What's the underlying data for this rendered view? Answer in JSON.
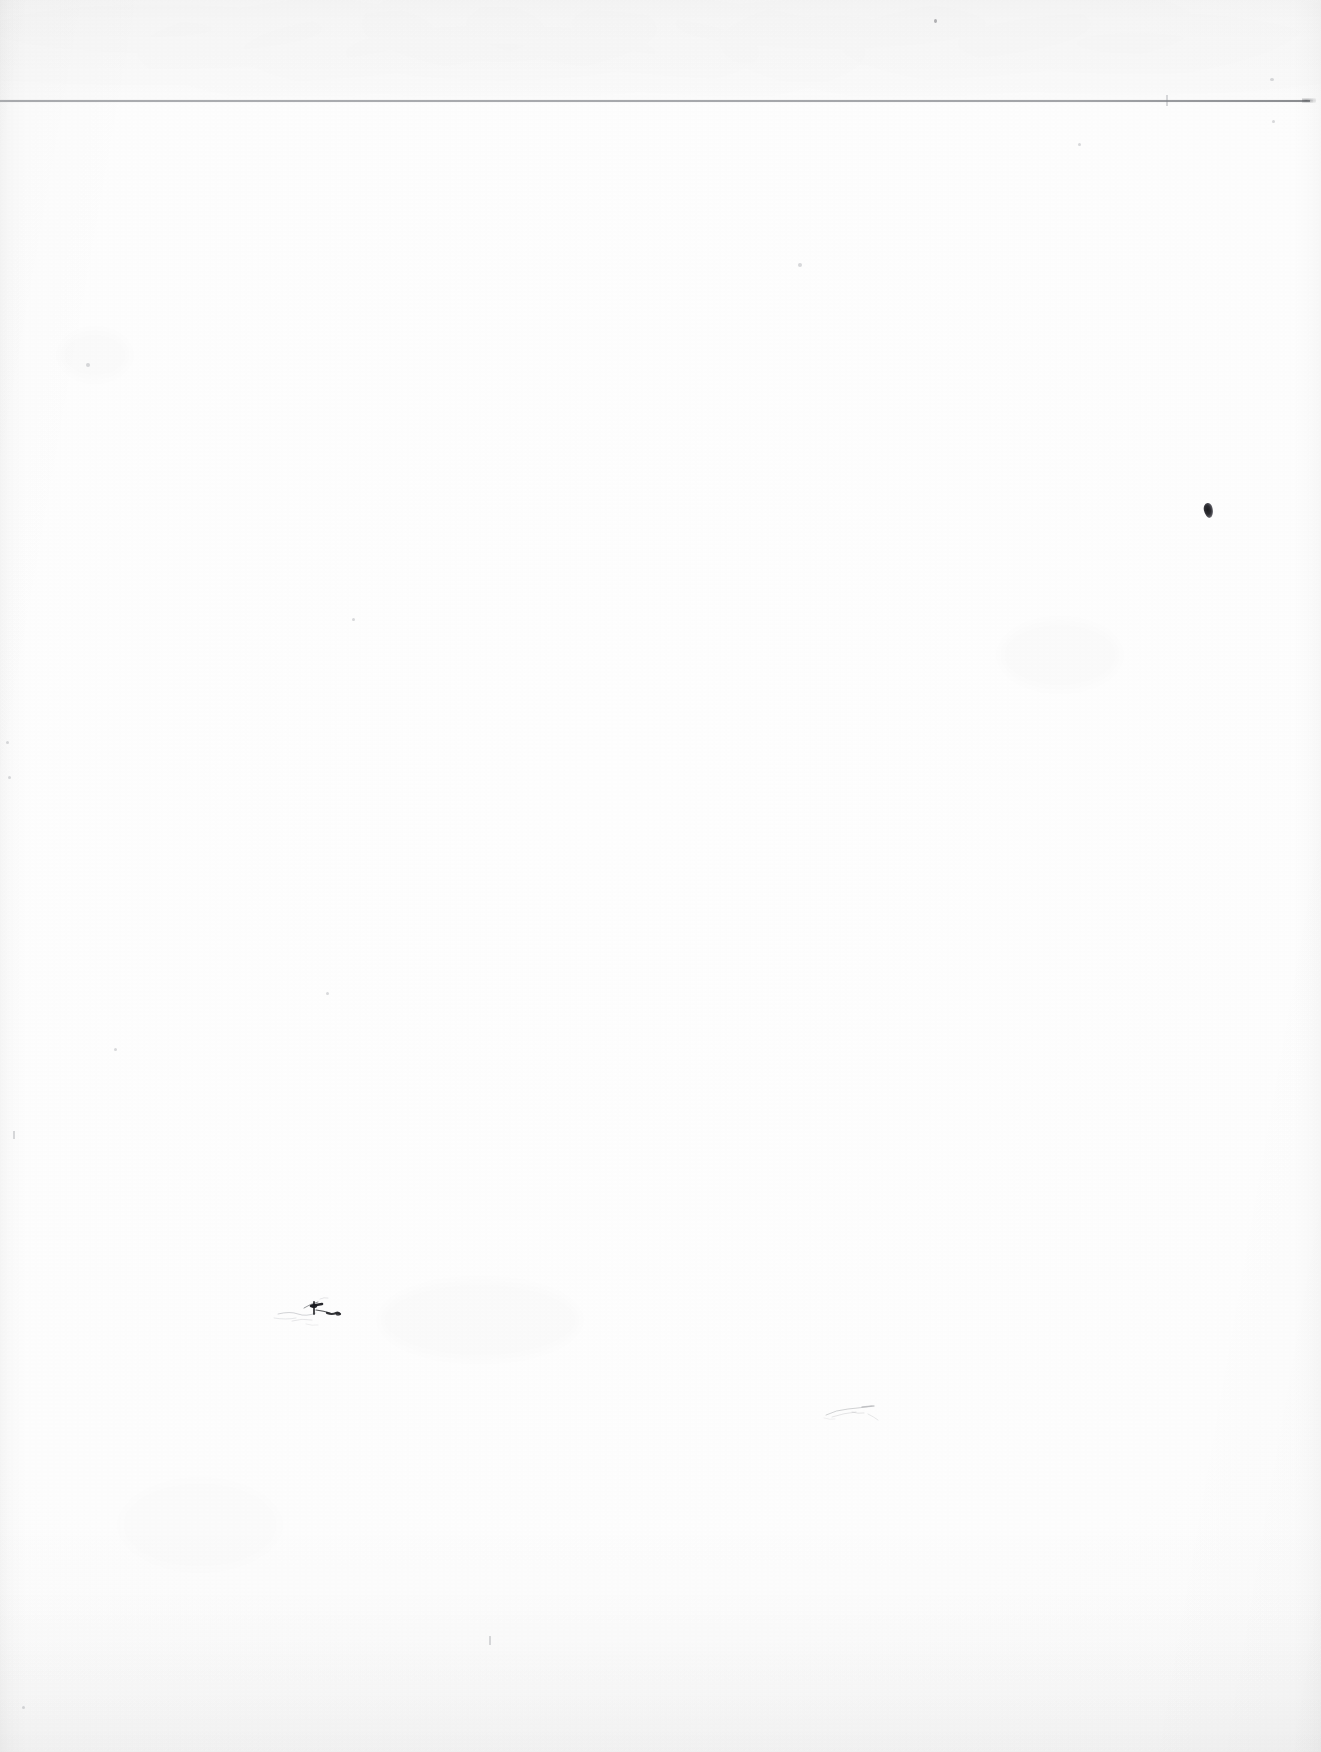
{
  "document": {
    "kind": "scanned-blank-page",
    "page_label": "",
    "text_content": "",
    "width_px": 1321,
    "height_px": 1752,
    "description": "Blank scanned sheet of paper with no printed text"
  },
  "colors": {
    "paper": "#fdfdfd",
    "paper_warm_center": "#fefefe",
    "paper_edge": "#f9f9f9",
    "rule_line": "#a2a4a8",
    "rule_line_dark_end": "#787a7e",
    "ink_mark": "#1b1b1f",
    "pencil_mark": "#5a5c62",
    "speck": "#5a5c62"
  },
  "features": {
    "top_band": {
      "name": "top-margin-band",
      "top_px": 0,
      "height_px": 100,
      "tone": "slightly darker gray than page body"
    },
    "horizontal_rule": {
      "name": "sheet-edge-rule",
      "y_px": 100,
      "x_start_px": 0,
      "x_end_px": 1310,
      "thickness_px": 2,
      "color": "#a2a4a8"
    },
    "edges": {
      "left_shadow_width_px": 26,
      "right_shadow_width_px": 30,
      "bottom_shadow_height_px": 150
    }
  },
  "marks": [
    {
      "id": "ink-dot-right",
      "type": "ink-dot",
      "x": 1204,
      "y": 503,
      "w": 9,
      "h": 15
    },
    {
      "id": "pencil-scribble",
      "type": "pencil",
      "x": 272,
      "y": 1294,
      "w": 90,
      "h": 42
    },
    {
      "id": "faint-pencil-bottom",
      "type": "pencil-faint",
      "x": 822,
      "y": 1400,
      "w": 70,
      "h": 26
    },
    {
      "id": "speck-top-center",
      "type": "speck",
      "x": 934,
      "y": 19,
      "w": 3,
      "h": 4
    },
    {
      "id": "speck-top-right",
      "type": "speck-faint",
      "x": 1270,
      "y": 78,
      "w": 4,
      "h": 3
    },
    {
      "id": "speck-top-right-2",
      "type": "speck-faint",
      "x": 1272,
      "y": 120,
      "w": 3,
      "h": 3
    },
    {
      "id": "speck-left-upper",
      "type": "speck-faint",
      "x": 86,
      "y": 363,
      "w": 4,
      "h": 4
    },
    {
      "id": "speck-left-mid",
      "type": "speck-faint",
      "x": 6,
      "y": 741,
      "w": 3,
      "h": 3
    },
    {
      "id": "speck-left-low",
      "type": "speck-faint",
      "x": 8,
      "y": 776,
      "w": 3,
      "h": 3
    },
    {
      "id": "speck-center-right",
      "type": "speck-faint",
      "x": 1078,
      "y": 143,
      "w": 3,
      "h": 3
    },
    {
      "id": "speck-center-top",
      "type": "speck-faint",
      "x": 798,
      "y": 263,
      "w": 4,
      "h": 4
    },
    {
      "id": "speck-mid-left",
      "type": "speck-faint",
      "x": 114,
      "y": 1048,
      "w": 3,
      "h": 3
    },
    {
      "id": "speck-upper-mid",
      "type": "speck-faint",
      "x": 352,
      "y": 618,
      "w": 3,
      "h": 3
    },
    {
      "id": "speck-low-left",
      "type": "speck-faint",
      "x": 326,
      "y": 992,
      "w": 3,
      "h": 3
    },
    {
      "id": "speck-bottom-left",
      "type": "speck-faint",
      "x": 22,
      "y": 1706,
      "w": 3,
      "h": 3
    },
    {
      "id": "fiber-right-top",
      "type": "fiber",
      "x": 1166,
      "y": 95,
      "w": 2,
      "h": 11
    },
    {
      "id": "fiber-bottom-mid",
      "type": "fiber",
      "x": 489,
      "y": 1636,
      "w": 2,
      "h": 9
    },
    {
      "id": "fiber-left-mid",
      "type": "fiber",
      "x": 13,
      "y": 1131,
      "w": 2,
      "h": 8
    }
  ]
}
